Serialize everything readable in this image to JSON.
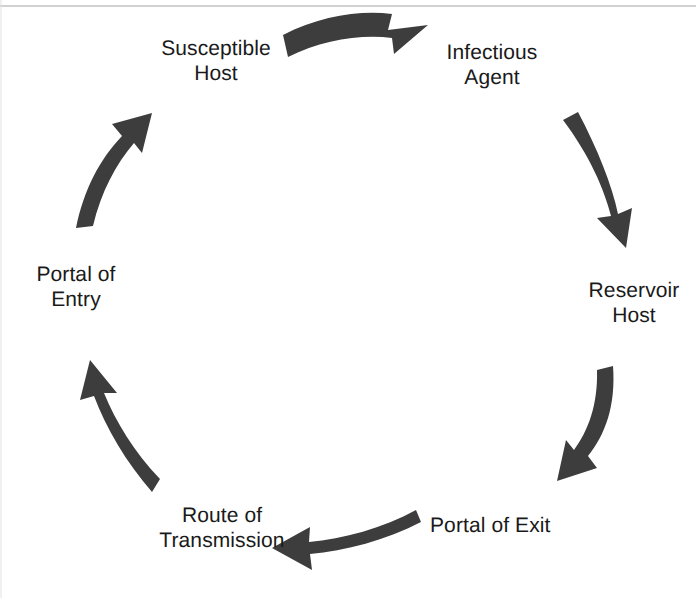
{
  "diagram": {
    "type": "cycle",
    "background_color": "#ffffff",
    "arrow_color": "#3d3d3d",
    "text_color": "#1a1a1a",
    "node_count": 6,
    "nodes": [
      {
        "id": "susceptible-host",
        "label": "Susceptible\nHost",
        "position": "top-left",
        "order": 1
      },
      {
        "id": "infectious-agent",
        "label": "Infectious\nAgent",
        "position": "top-right",
        "order": 2
      },
      {
        "id": "reservoir-host",
        "label": "Reservoir\nHost",
        "position": "right",
        "order": 3
      },
      {
        "id": "portal-of-exit",
        "label": "Portal of Exit",
        "position": "bottom-right",
        "order": 4
      },
      {
        "id": "route-of-transmission",
        "label": "Route of\nTransmission",
        "position": "bottom-left",
        "order": 5
      },
      {
        "id": "portal-of-entry",
        "label": "Portal of\nEntry",
        "position": "left",
        "order": 6
      }
    ],
    "arrows": [
      {
        "id": "arrow-susceptible-to-infectious",
        "from": "susceptible-host",
        "to": "infectious-agent",
        "direction": "right"
      },
      {
        "id": "arrow-infectious-to-reservoir",
        "from": "infectious-agent",
        "to": "reservoir-host",
        "direction": "down"
      },
      {
        "id": "arrow-reservoir-to-exit",
        "from": "reservoir-host",
        "to": "portal-of-exit",
        "direction": "down-left"
      },
      {
        "id": "arrow-exit-to-transmission",
        "from": "portal-of-exit",
        "to": "route-of-transmission",
        "direction": "left"
      },
      {
        "id": "arrow-transmission-to-entry",
        "from": "route-of-transmission",
        "to": "portal-of-entry",
        "direction": "up-left"
      },
      {
        "id": "arrow-entry-to-susceptible",
        "from": "portal-of-entry",
        "to": "susceptible-host",
        "direction": "up-right"
      }
    ]
  }
}
